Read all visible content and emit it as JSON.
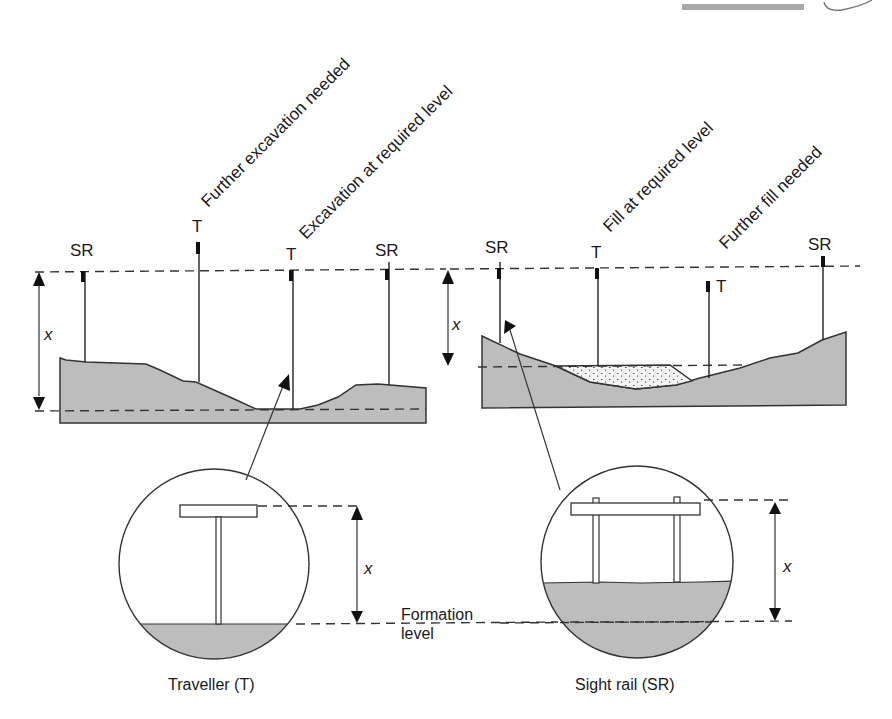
{
  "figure": {
    "decoration": {
      "top_bar_color": "#a9a9a9"
    },
    "left_profile": {
      "title": "Excavation (cutting) profile",
      "labels": {
        "sr_left": "SR",
        "t_further": "T",
        "t_required": "T",
        "sr_right": "SR",
        "x": "x"
      },
      "annotations": {
        "further_excavation": "Further excavation needed",
        "excavation_required": "Excavation at required level"
      }
    },
    "right_profile": {
      "title": "Fill (embankment) profile",
      "labels": {
        "sr_left": "SR",
        "t_required": "T",
        "t_further": "T",
        "sr_right": "SR",
        "x": "x"
      },
      "annotations": {
        "fill_required": "Fill at required level",
        "further_fill": "Further fill needed"
      }
    },
    "detail_traveller": {
      "caption": "Traveller (T)",
      "x_label": "x"
    },
    "detail_sight_rail": {
      "caption": "Sight rail (SR)",
      "x_label": "x"
    },
    "formation_level": {
      "line1": "Formation",
      "line2": "level"
    },
    "colors": {
      "ground": "#bdbdbd",
      "line": "#333333",
      "fill_material": "#f3f3f3"
    }
  }
}
